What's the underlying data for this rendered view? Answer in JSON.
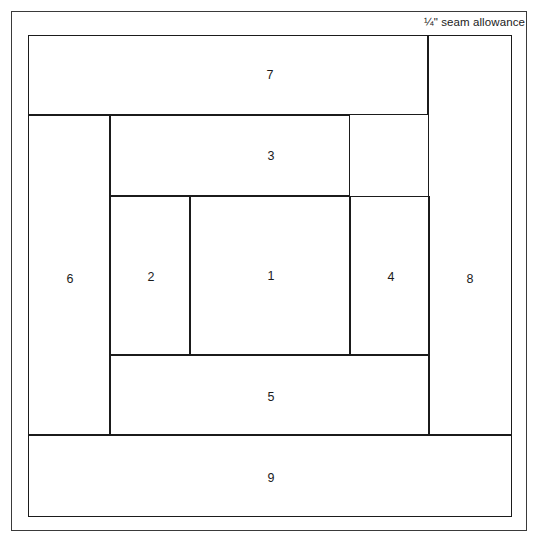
{
  "diagram": {
    "kind": "foundation-piecing-block",
    "seam_allowance_note": "¼\" seam allowance",
    "line_color": "#1b1b1b",
    "frame_color": "#3a3a3a",
    "background_color": "#ffffff",
    "canvas": {
      "width": 538,
      "height": 545
    },
    "image_frame": {
      "x": 11,
      "y": 11,
      "width": 516,
      "height": 520
    },
    "block_outline": {
      "x": 28,
      "y": 35,
      "width": 484,
      "height": 482
    },
    "pieces": [
      {
        "number": "1",
        "x": 190,
        "y": 196,
        "width": 160,
        "height": 159,
        "label_x": 270,
        "label_y": 275
      },
      {
        "number": "2",
        "x": 110,
        "y": 196,
        "width": 80,
        "height": 159,
        "label_x": 150,
        "label_y": 276
      },
      {
        "number": "3",
        "x": 110,
        "y": 115,
        "width": 240,
        "height": 81,
        "label_x": 270,
        "label_y": 155
      },
      {
        "number": "4",
        "x": 350,
        "y": 196,
        "width": 80,
        "height": 159,
        "label_x": 390,
        "label_y": 276
      },
      {
        "number": "5",
        "x": 110,
        "y": 355,
        "width": 320,
        "height": 80,
        "label_x": 270,
        "label_y": 396
      },
      {
        "number": "6",
        "x": 28,
        "y": 115,
        "width": 82,
        "height": 320,
        "label_x": 69,
        "label_y": 278
      },
      {
        "number": "7",
        "x": 28,
        "y": 35,
        "width": 400,
        "height": 80,
        "label_x": 269,
        "label_y": 74
      },
      {
        "number": "8",
        "x": 428,
        "y": 35,
        "width": 84,
        "height": 400,
        "label_x": 469,
        "label_y": 278
      },
      {
        "number": "9",
        "x": 28,
        "y": 435,
        "width": 484,
        "height": 82,
        "label_x": 270,
        "label_y": 477
      }
    ]
  }
}
